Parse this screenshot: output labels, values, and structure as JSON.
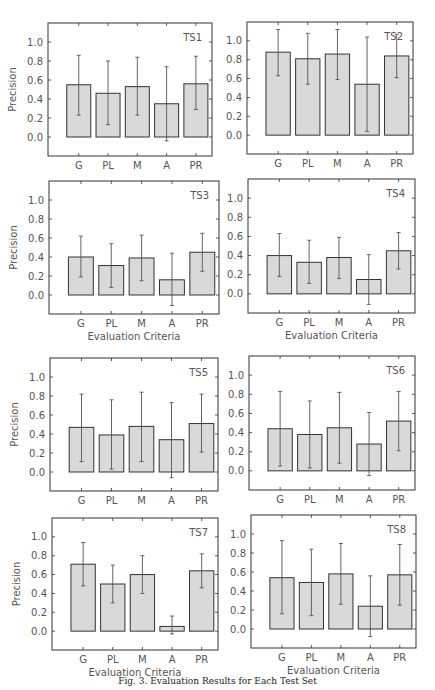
{
  "figure": {
    "caption": "Fig. 3. Evaluation Results for Each Test Set"
  },
  "chart_data": [
    {
      "type": "bar",
      "title": "TS1",
      "categories": [
        "G",
        "PL",
        "M",
        "A",
        "PR"
      ],
      "values": [
        0.55,
        0.46,
        0.53,
        0.35,
        0.56
      ],
      "err_low": [
        0.23,
        0.13,
        0.23,
        -0.04,
        0.29
      ],
      "err_high": [
        0.86,
        0.8,
        0.84,
        0.74,
        0.85
      ],
      "xlabel": "",
      "ylabel": "Precision",
      "ylim": [
        -0.2,
        1.2
      ],
      "yticks": [
        "0.0",
        "0.2",
        "0.4",
        "0.6",
        "0.8",
        "1.0"
      ],
      "grid": false,
      "legend": "none"
    },
    {
      "type": "bar",
      "title": "TS2",
      "categories": [
        "G",
        "PL",
        "M",
        "A",
        "PR"
      ],
      "values": [
        0.88,
        0.81,
        0.86,
        0.54,
        0.84
      ],
      "err_low": [
        0.63,
        0.54,
        0.59,
        0.04,
        0.61
      ],
      "err_high": [
        1.12,
        1.08,
        1.12,
        1.04,
        1.07
      ],
      "xlabel": "",
      "ylabel": "",
      "ylim": [
        -0.2,
        1.2
      ],
      "yticks": [
        "0.0",
        "0.2",
        "0.4",
        "0.6",
        "0.8",
        "1.0"
      ],
      "grid": false,
      "legend": "none"
    },
    {
      "type": "bar",
      "title": "TS3",
      "categories": [
        "G",
        "PL",
        "M",
        "A",
        "PR"
      ],
      "values": [
        0.4,
        0.31,
        0.39,
        0.16,
        0.45
      ],
      "err_low": [
        0.19,
        0.08,
        0.15,
        -0.11,
        0.25
      ],
      "err_high": [
        0.62,
        0.54,
        0.63,
        0.44,
        0.65
      ],
      "xlabel": "Evaluation Criteria",
      "ylabel": "Precision",
      "ylim": [
        -0.2,
        1.2
      ],
      "yticks": [
        "0.0",
        "0.2",
        "0.4",
        "0.6",
        "0.8",
        "1.0"
      ],
      "grid": false,
      "legend": "none"
    },
    {
      "type": "bar",
      "title": "TS4",
      "categories": [
        "G",
        "PL",
        "M",
        "A",
        "PR"
      ],
      "values": [
        0.4,
        0.33,
        0.38,
        0.15,
        0.45
      ],
      "err_low": [
        0.18,
        0.11,
        0.16,
        -0.11,
        0.26
      ],
      "err_high": [
        0.63,
        0.56,
        0.59,
        0.41,
        0.64
      ],
      "xlabel": "Evaluation Criteria",
      "ylabel": "",
      "ylim": [
        -0.2,
        1.2
      ],
      "yticks": [
        "0.0",
        "0.2",
        "0.4",
        "0.6",
        "0.8",
        "1.0"
      ],
      "grid": false,
      "legend": "none"
    },
    {
      "type": "bar",
      "title": "TS5",
      "categories": [
        "G",
        "PL",
        "M",
        "A",
        "PR"
      ],
      "values": [
        0.47,
        0.39,
        0.48,
        0.34,
        0.51
      ],
      "err_low": [
        0.11,
        0.03,
        0.11,
        -0.06,
        0.21
      ],
      "err_high": [
        0.82,
        0.76,
        0.84,
        0.73,
        0.82
      ],
      "xlabel": "",
      "ylabel": "Precision",
      "ylim": [
        -0.2,
        1.2
      ],
      "yticks": [
        "0.0",
        "0.2",
        "0.4",
        "0.6",
        "0.8",
        "1.0"
      ],
      "grid": false,
      "legend": "none"
    },
    {
      "type": "bar",
      "title": "TS6",
      "categories": [
        "G",
        "PL",
        "M",
        "A",
        "PR"
      ],
      "values": [
        0.44,
        0.38,
        0.45,
        0.28,
        0.52
      ],
      "err_low": [
        0.05,
        0.03,
        0.08,
        -0.05,
        0.21
      ],
      "err_high": [
        0.83,
        0.73,
        0.82,
        0.61,
        0.83
      ],
      "xlabel": "",
      "ylabel": "",
      "ylim": [
        -0.2,
        1.2
      ],
      "yticks": [
        "0.0",
        "0.2",
        "0.4",
        "0.6",
        "0.8",
        "1.0"
      ],
      "grid": false,
      "legend": "none"
    },
    {
      "type": "bar",
      "title": "TS7",
      "categories": [
        "G",
        "PL",
        "M",
        "A",
        "PR"
      ],
      "values": [
        0.71,
        0.5,
        0.6,
        0.05,
        0.64
      ],
      "err_low": [
        0.48,
        0.3,
        0.4,
        -0.03,
        0.46
      ],
      "err_high": [
        0.94,
        0.7,
        0.8,
        0.16,
        0.82
      ],
      "xlabel": "Evaluation Criteria",
      "ylabel": "Precision",
      "ylim": [
        -0.2,
        1.2
      ],
      "yticks": [
        "0.0",
        "0.2",
        "0.4",
        "0.6",
        "0.8",
        "1.0"
      ],
      "grid": false,
      "legend": "none"
    },
    {
      "type": "bar",
      "title": "TS8",
      "categories": [
        "G",
        "PL",
        "M",
        "A",
        "PR"
      ],
      "values": [
        0.54,
        0.49,
        0.58,
        0.24,
        0.57
      ],
      "err_low": [
        0.16,
        0.14,
        0.26,
        -0.08,
        0.25
      ],
      "err_high": [
        0.93,
        0.84,
        0.9,
        0.56,
        0.89
      ],
      "xlabel": "Evaluation Criteria",
      "ylabel": "",
      "ylim": [
        -0.2,
        1.2
      ],
      "yticks": [
        "0.0",
        "0.2",
        "0.4",
        "0.6",
        "0.8",
        "1.0"
      ],
      "grid": false,
      "legend": "none"
    }
  ],
  "layout": {
    "bar_color": "#d9d9d9",
    "edge_color": "#333333",
    "err_color": "#555555",
    "frames": [
      {
        "left": 48,
        "top": 23,
        "right": 212,
        "bottom": 156
      },
      {
        "left": 247,
        "top": 22,
        "right": 413,
        "bottom": 154
      },
      {
        "left": 49,
        "top": 181,
        "right": 219,
        "bottom": 314
      },
      {
        "left": 248,
        "top": 179,
        "right": 415,
        "bottom": 313
      },
      {
        "left": 50,
        "top": 358,
        "right": 218,
        "bottom": 491
      },
      {
        "left": 249,
        "top": 356,
        "right": 415,
        "bottom": 490
      },
      {
        "left": 52,
        "top": 518,
        "right": 218,
        "bottom": 650
      },
      {
        "left": 251,
        "top": 515,
        "right": 416,
        "bottom": 648
      }
    ]
  }
}
